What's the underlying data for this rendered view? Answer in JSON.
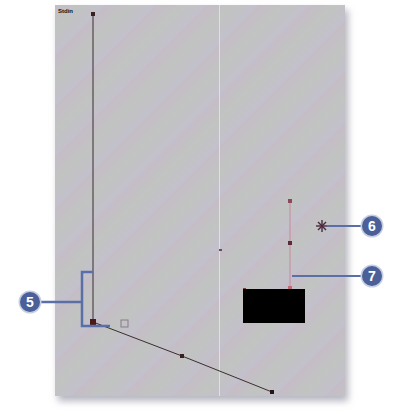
{
  "canvas": {
    "label": "Stdin",
    "background": "#c3c1c6"
  },
  "shapes": {
    "main_path": {
      "points": [
        [
          93,
          14
        ],
        [
          93,
          322
        ],
        [
          182,
          356
        ],
        [
          272,
          392
        ]
      ],
      "stroke": "#3a2e2e"
    },
    "handle_path": {
      "points": [
        [
          290,
          201
        ],
        [
          290,
          243
        ],
        [
          290,
          289
        ]
      ],
      "stroke": "#c98a9a"
    },
    "black_rect": {
      "x": 243,
      "y": 289,
      "w": 62,
      "h": 34,
      "fill": "#000000"
    },
    "star_point": {
      "x": 322,
      "y": 226
    },
    "center_dot": {
      "x": 220,
      "y": 250
    },
    "small_square": {
      "x": 121,
      "y": 320,
      "size": 7
    }
  },
  "callouts": [
    {
      "number": "5",
      "color": "#4b5f98"
    },
    {
      "number": "6",
      "color": "#4b5f98"
    },
    {
      "number": "7",
      "color": "#4b5f98"
    }
  ]
}
